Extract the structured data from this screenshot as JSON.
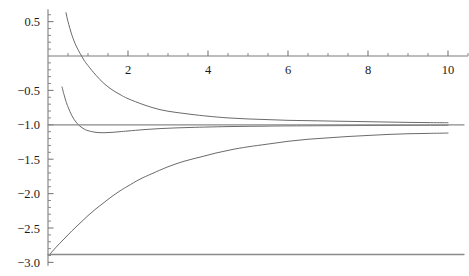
{
  "chart_data": {
    "type": "line",
    "title": "",
    "xlabel": "",
    "ylabel": "",
    "xlim": [
      0,
      10.5
    ],
    "ylim": [
      -3.05,
      0.68
    ],
    "grid": false,
    "legend": "none",
    "axis_style": "mathematica-cross-axes",
    "x_axis_position_y": 0,
    "y_axis_position_x": 0,
    "xticks": [
      2,
      4,
      6,
      8,
      10
    ],
    "xtick_labels": [
      "2",
      "4",
      "6",
      "8",
      "10"
    ],
    "x_minor_tick_step": 0.5,
    "yticks": [
      0.5,
      -0.5,
      -1.0,
      -1.5,
      -2.0,
      -2.5,
      -3.0
    ],
    "ytick_labels": [
      "0.5",
      "-0.5",
      "-1.0",
      "-1.5",
      "-2.0",
      "-2.5",
      "-3.0"
    ],
    "y_minor_tick_step": 0.1,
    "series": [
      {
        "name": "upper-decaying-curve",
        "color": "#6b6b6b",
        "x": [
          0.45,
          0.5,
          0.6,
          0.7,
          0.8,
          0.9,
          1.0,
          1.2,
          1.4,
          1.6,
          1.8,
          2.0,
          2.4,
          2.8,
          3.2,
          3.6,
          4.0,
          4.5,
          5.0,
          5.5,
          6.0,
          6.5,
          7.0,
          7.5,
          8.0,
          8.5,
          9.0,
          9.5,
          10.0
        ],
        "y": [
          0.63,
          0.5,
          0.3,
          0.15,
          0.04,
          -0.06,
          -0.14,
          -0.28,
          -0.4,
          -0.49,
          -0.56,
          -0.62,
          -0.71,
          -0.78,
          -0.82,
          -0.85,
          -0.875,
          -0.9,
          -0.915,
          -0.925,
          -0.935,
          -0.94,
          -0.945,
          -0.95,
          -0.955,
          -0.96,
          -0.965,
          -0.968,
          -0.97
        ]
      },
      {
        "name": "middle-dipping-curve",
        "color": "#6b6b6b",
        "x": [
          0.35,
          0.4,
          0.45,
          0.5,
          0.6,
          0.7,
          0.8,
          0.9,
          1.0,
          1.2,
          1.4,
          1.6,
          1.8,
          2.0,
          2.4,
          2.8,
          3.2,
          3.6,
          4.0,
          4.5,
          5.0,
          5.5,
          6.0,
          7.0,
          8.0,
          9.0,
          10.0
        ],
        "y": [
          -0.45,
          -0.56,
          -0.66,
          -0.74,
          -0.87,
          -0.96,
          -1.02,
          -1.06,
          -1.085,
          -1.11,
          -1.115,
          -1.11,
          -1.1,
          -1.09,
          -1.07,
          -1.055,
          -1.045,
          -1.038,
          -1.032,
          -1.026,
          -1.022,
          -1.019,
          -1.016,
          -1.013,
          -1.01,
          -1.008,
          -1.007
        ]
      },
      {
        "name": "lower-rising-curve",
        "color": "#6b6b6b",
        "x": [
          0.05,
          0.2,
          0.4,
          0.6,
          0.8,
          1.0,
          1.2,
          1.4,
          1.6,
          1.8,
          2.0,
          2.3,
          2.6,
          3.0,
          3.4,
          3.8,
          4.2,
          4.6,
          5.0,
          5.5,
          6.0,
          6.5,
          7.0,
          7.5,
          8.0,
          8.5,
          9.0,
          9.5,
          10.0
        ],
        "y": [
          -2.88,
          -2.78,
          -2.66,
          -2.54,
          -2.43,
          -2.32,
          -2.22,
          -2.13,
          -2.04,
          -1.96,
          -1.89,
          -1.79,
          -1.71,
          -1.61,
          -1.53,
          -1.47,
          -1.41,
          -1.36,
          -1.32,
          -1.28,
          -1.24,
          -1.21,
          -1.19,
          -1.17,
          -1.155,
          -1.14,
          -1.13,
          -1.125,
          -1.12
        ]
      },
      {
        "name": "asymptote-line-minus-one",
        "color": "#8a8a8a",
        "x": [
          0.0,
          10.4
        ],
        "y": [
          -1.0,
          -1.0
        ]
      },
      {
        "name": "baseline-line-minus-2point88",
        "color": "#8a8a8a",
        "x": [
          0.0,
          10.4
        ],
        "y": [
          -2.885,
          -2.885
        ]
      }
    ]
  },
  "axes": {
    "x_axis_name": "horizontal-axis",
    "y_axis_name": "vertical-axis",
    "axis_color": "#7d7d7d"
  }
}
